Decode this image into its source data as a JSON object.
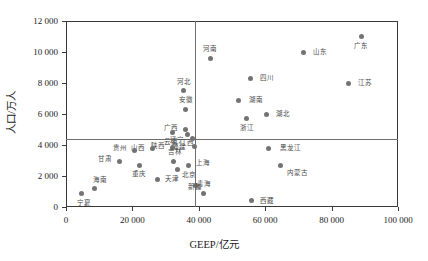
{
  "chart_data": {
    "type": "scatter",
    "title": "",
    "xlabel": "GEEP/亿元",
    "ylabel": "人口/万人",
    "xlim": [
      0,
      100000
    ],
    "ylim": [
      0,
      12000
    ],
    "xticks": [
      0,
      20000,
      40000,
      60000,
      80000,
      100000
    ],
    "xticklabels": [
      "0",
      "20 000",
      "40 000",
      "60 000",
      "80 000",
      "100 000"
    ],
    "yticks": [
      0,
      2000,
      4000,
      6000,
      8000,
      10000,
      12000
    ],
    "yticklabels": [
      "0",
      "2 000",
      "4 000",
      "6 000",
      "8 000",
      "10 000",
      "12 000"
    ],
    "grid": false,
    "legend": null,
    "marker_color": "#737373",
    "reference_lines": {
      "vertical_x": 39000,
      "horizontal_y": 4400,
      "color": "#6e6e6e"
    },
    "points": [
      {
        "name": "广东",
        "x": 89000,
        "y": 11000,
        "label_dx": 0,
        "label_dy": 9
      },
      {
        "name": "山东",
        "x": 71500,
        "y": 10000,
        "label_dx": 17,
        "label_dy": 0
      },
      {
        "name": "河南",
        "x": 43500,
        "y": 9600,
        "label_dx": 0,
        "label_dy": -9
      },
      {
        "name": "江苏",
        "x": 85000,
        "y": 8000,
        "label_dx": 17,
        "label_dy": 0
      },
      {
        "name": "四川",
        "x": 55500,
        "y": 8300,
        "label_dx": 17,
        "label_dy": 0
      },
      {
        "name": "河北",
        "x": 35500,
        "y": 7500,
        "label_dx": 0,
        "label_dy": -9
      },
      {
        "name": "湖南",
        "x": 52000,
        "y": 6900,
        "label_dx": 17,
        "label_dy": 0
      },
      {
        "name": "湖北",
        "x": 60500,
        "y": 6000,
        "label_dx": 16,
        "label_dy": 0
      },
      {
        "name": "安徽",
        "x": 36000,
        "y": 6300,
        "label_dx": 0,
        "label_dy": -9
      },
      {
        "name": "浙江",
        "x": 54500,
        "y": 5700,
        "label_dx": 0,
        "label_dy": 9
      },
      {
        "name": "广西",
        "x": 36000,
        "y": 5000,
        "label_dx": -15,
        "label_dy": -2
      },
      {
        "name": "江西",
        "x": 36500,
        "y": 4700,
        "label_dx": 0,
        "label_dy": 9
      },
      {
        "name": "云南",
        "x": 32000,
        "y": 4800,
        "label_dx": -1,
        "label_dy": 9
      },
      {
        "name": "辽宁",
        "x": 38000,
        "y": 4400,
        "label_dx": -15,
        "label_dy": 1
      },
      {
        "name": "福建",
        "x": 38700,
        "y": 3900,
        "label_dx": -15,
        "label_dy": 0
      },
      {
        "name": "黑龙江",
        "x": 61000,
        "y": 3800,
        "label_dx": 22,
        "label_dy": 0
      },
      {
        "name": "陕西",
        "x": 32000,
        "y": 3850,
        "label_dx": -14,
        "label_dy": -1
      },
      {
        "name": "山西",
        "x": 26000,
        "y": 3750,
        "label_dx": -14,
        "label_dy": -1
      },
      {
        "name": "贵州",
        "x": 20500,
        "y": 3650,
        "label_dx": -14,
        "label_dy": -2
      },
      {
        "name": "吉林",
        "x": 32500,
        "y": 2950,
        "label_dx": 1,
        "label_dy": -9
      },
      {
        "name": "上海",
        "x": 37000,
        "y": 2700,
        "label_dx": 14,
        "label_dy": -2
      },
      {
        "name": "北京",
        "x": 33500,
        "y": 2400,
        "label_dx": 12,
        "label_dy": 5
      },
      {
        "name": "内蒙古",
        "x": 64500,
        "y": 2700,
        "label_dx": 17,
        "label_dy": 8
      },
      {
        "name": "重庆",
        "x": 22000,
        "y": 2700,
        "label_dx": 0,
        "label_dy": 9
      },
      {
        "name": "甘肃",
        "x": 16000,
        "y": 2950,
        "label_dx": -14,
        "label_dy": -2
      },
      {
        "name": "天津",
        "x": 27500,
        "y": 1800,
        "label_dx": 15,
        "label_dy": 0
      },
      {
        "name": "新疆",
        "x": 39000,
        "y": 1400,
        "label_dx": 0,
        "label_dy": 2
      },
      {
        "name": "海南",
        "x": 8500,
        "y": 1200,
        "label_dx": 6,
        "label_dy": -8
      },
      {
        "name": "宁夏",
        "x": 4800,
        "y": 850,
        "label_dx": 2,
        "label_dy": 9
      },
      {
        "name": "青海",
        "x": 41500,
        "y": 850,
        "label_dx": 0,
        "label_dy": -10
      },
      {
        "name": "西藏",
        "x": 56000,
        "y": 400,
        "label_dx": 15,
        "label_dy": 0
      }
    ]
  }
}
